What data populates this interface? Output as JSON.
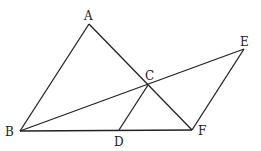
{
  "diagram": {
    "type": "geometry",
    "points": {
      "A": {
        "label": "A",
        "x": 89,
        "y": 24
      },
      "B": {
        "label": "B",
        "x": 20,
        "y": 131
      },
      "C": {
        "label": "C",
        "x": 148,
        "y": 85
      },
      "D": {
        "label": "D",
        "x": 119,
        "y": 130
      },
      "E": {
        "label": "E",
        "x": 244,
        "y": 49
      },
      "F": {
        "label": "F",
        "x": 192,
        "y": 130
      }
    },
    "segments": [
      [
        "A",
        "B"
      ],
      [
        "A",
        "F"
      ],
      [
        "B",
        "F"
      ],
      [
        "B",
        "E"
      ],
      [
        "C",
        "D"
      ],
      [
        "E",
        "F"
      ]
    ]
  }
}
